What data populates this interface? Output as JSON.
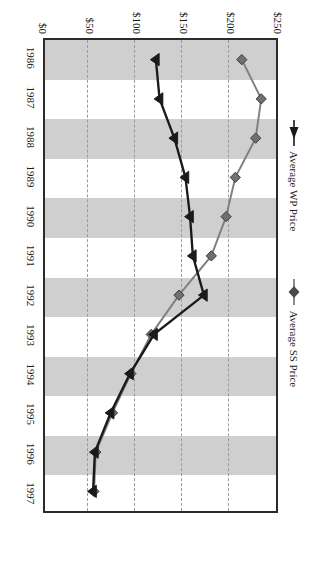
{
  "chart_data": {
    "type": "line",
    "title": "",
    "orientation": "rotated-90",
    "xlabel": "",
    "ylabel": "",
    "categories": [
      "1986",
      "1987",
      "1988",
      "1989",
      "1990",
      "1991",
      "1992",
      "1993",
      "1994",
      "1995",
      "1996",
      "1997"
    ],
    "value_ticks": [
      "$250",
      "$200",
      "$150",
      "$100",
      "$50",
      "$0"
    ],
    "value_tick_numbers": [
      250,
      200,
      150,
      100,
      50,
      0
    ],
    "ylim": [
      0,
      250
    ],
    "value_axis_reversed": true,
    "grid": "dashed vertical gridlines at each value tick; alternating gray category bands",
    "legend_position": "top",
    "series": [
      {
        "name": "Average SS Price",
        "marker": "diamond",
        "color": "#808080",
        "line_color": "#808080",
        "values": [
          213,
          234,
          228,
          206,
          196,
          180,
          145,
          115,
          93,
          73,
          55,
          53
        ]
      },
      {
        "name": "Average WP Price",
        "marker": "triangle",
        "color": "#1a1a1a",
        "line_color": "#1a1a1a",
        "values": [
          120,
          124,
          140,
          152,
          157,
          160,
          172,
          118,
          92,
          71,
          54,
          52
        ]
      }
    ]
  },
  "legend": {
    "entries": [
      {
        "label": "Average WP Price",
        "marker": "triangle-marker-icon"
      },
      {
        "label": "Average SS Price",
        "marker": "diamond-marker-icon"
      }
    ]
  },
  "axes": {
    "value_axis_name": "value-axis",
    "category_axis_name": "category-axis"
  }
}
